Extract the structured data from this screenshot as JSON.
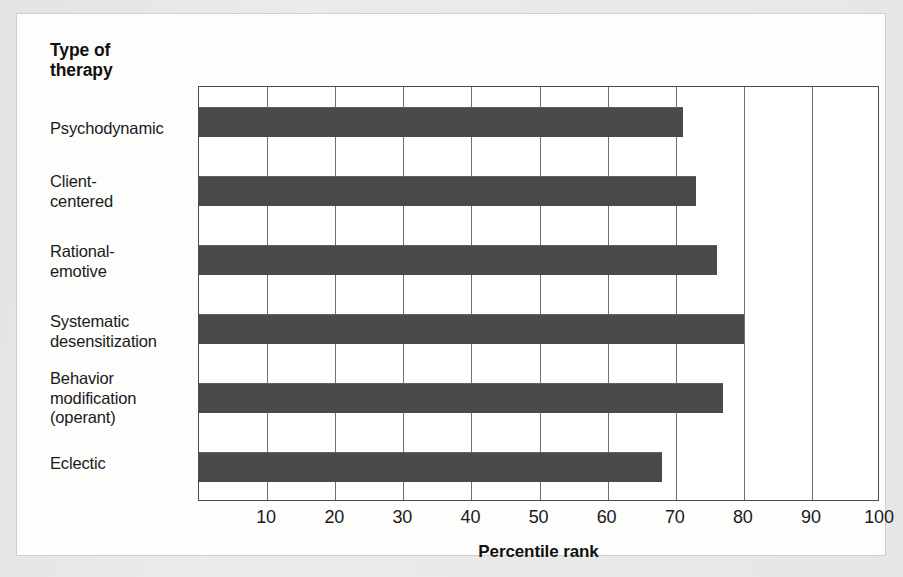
{
  "figure": {
    "y_axis_title_line1": "Type of",
    "y_axis_title_line2": "therapy",
    "x_axis_title": "Percentile rank",
    "background_color": "#e6e6e4",
    "canvas_color": "#fdfdfc",
    "bar_color": "#4a4a4a",
    "axis_color": "#4b4b4b",
    "gridline_color": "#6f6f6f"
  },
  "chart_data": {
    "type": "bar",
    "orientation": "horizontal",
    "title": "",
    "subtitle": "",
    "xlabel": "Percentile rank",
    "ylabel": "Type of therapy",
    "xlim": [
      0,
      100
    ],
    "xticks": [
      10,
      20,
      30,
      40,
      50,
      60,
      70,
      80,
      90,
      100
    ],
    "xtick_labels": [
      "10",
      "20",
      "30",
      "40",
      "50",
      "60",
      "70",
      "80",
      "90",
      "100"
    ],
    "grid": "vertical",
    "legend": "none",
    "categories": [
      "Psychodynamic",
      "Client-centered",
      "Rational-emotive",
      "Systematic desensitization",
      "Behavior modification (operant)",
      "Eclectic"
    ],
    "values": [
      71,
      73,
      76,
      80,
      77,
      68
    ],
    "series": [
      {
        "name": "Percentile rank",
        "values": [
          71,
          73,
          76,
          80,
          77,
          68
        ]
      }
    ],
    "category_label_lines": [
      [
        "Psychodynamic"
      ],
      [
        "Client-",
        "centered"
      ],
      [
        "Rational-",
        "emotive"
      ],
      [
        "Systematic",
        "desensitization"
      ],
      [
        "Behavior",
        "modification",
        "(operant)"
      ],
      [
        "Eclectic"
      ]
    ]
  }
}
